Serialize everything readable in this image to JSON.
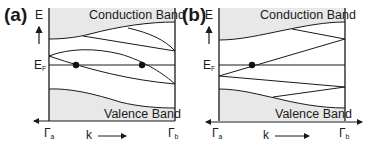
{
  "panels": [
    {
      "id": "a",
      "label": "(a)",
      "y_axis_label": "E",
      "fermi_label": "E",
      "fermi_sub": "F",
      "conduction_label": "Conduction Band",
      "valence_label": "Valence Band",
      "x_left_label": "Γ",
      "x_left_sub": "a",
      "x_mid_label": "k",
      "x_right_label": "Γ",
      "x_right_sub": "b",
      "fermi_crossings": 2
    },
    {
      "id": "b",
      "label": "(b)",
      "y_axis_label": "E",
      "fermi_label": "E",
      "fermi_sub": "F",
      "conduction_label": "Conduction Band",
      "valence_label": "Valence Band",
      "x_left_label": "Γ",
      "x_left_sub": "a",
      "x_mid_label": "k",
      "x_right_label": "Γ",
      "x_right_sub": "b",
      "fermi_crossings": 1
    }
  ],
  "colors": {
    "band_fill": "#e8e8e8",
    "line": "#1a1a1a"
  }
}
